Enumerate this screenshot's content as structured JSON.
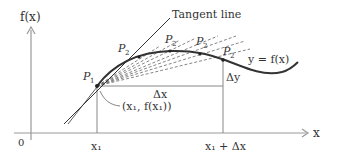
{
  "diagram": {
    "y_axis_label": "f(x)",
    "x_axis_label": "x",
    "origin_label": "0",
    "tangent_label": "Tangent line",
    "curve_label": "y = f(x)",
    "point_p1_label": "P",
    "point_p1_sub": "1",
    "point_p2_label": "P",
    "point_p2_sub": "2",
    "point_coords_label": "(x₁, f(x₁))",
    "delta_x_label": "Δx",
    "delta_y_label": "Δy",
    "x1_tick_label": "x₁",
    "x1_plus_dx_tick_label": "x₁ + Δx",
    "colors": {
      "axis": "#999999",
      "curve": "#333333",
      "secant": "#666666",
      "text": "#333333"
    }
  }
}
